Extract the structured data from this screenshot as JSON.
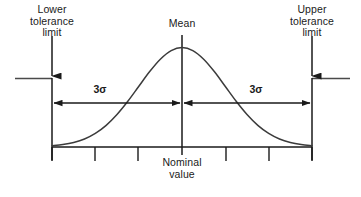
{
  "figure": {
    "labels": {
      "lower_tolerance": "Lower\ntolerance\nlimit",
      "upper_tolerance": "Upper\ntolerance\nlimit",
      "mean": "Mean",
      "nominal": "Nominal\nvalue",
      "sigma_left": "3σ",
      "sigma_right": "3σ"
    },
    "colors": {
      "line": "#1a1a1a",
      "curve": "#3b3b3b",
      "text": "#1a1a1a",
      "background": "#ffffff"
    }
  },
  "chart_data": {
    "type": "line",
    "xlabel": "Nominal value",
    "ylabel": "",
    "grid": false,
    "legend": null,
    "annotations": [
      {
        "name": "lower-tolerance-limit",
        "text": "Lower tolerance limit",
        "x": -3,
        "marker": "down-arrow"
      },
      {
        "name": "upper-tolerance-limit",
        "text": "Upper tolerance limit",
        "x": 3,
        "marker": "down-arrow"
      },
      {
        "name": "mean-line",
        "text": "Mean",
        "x": 0,
        "marker": "vertical-line"
      },
      {
        "name": "nominal-value",
        "text": "Nominal value",
        "x": 0,
        "marker": "axis-label"
      },
      {
        "name": "sigma-span-left",
        "text": "3σ",
        "from_x": -3,
        "to_x": 0,
        "marker": "double-arrow"
      },
      {
        "name": "sigma-span-right",
        "text": "3σ",
        "from_x": 0,
        "to_x": 3,
        "marker": "double-arrow"
      }
    ],
    "xlim": [
      -3,
      3
    ],
    "ylim": [
      0,
      1
    ],
    "xticks": [
      -3,
      -2,
      -1,
      0,
      1,
      2,
      3
    ],
    "xticklabels": [
      "",
      "",
      "",
      "",
      "",
      "",
      ""
    ],
    "series": [
      {
        "name": "normal-distribution",
        "mean": 0,
        "sigma": 1,
        "x": [
          -3.0,
          -2.75,
          -2.5,
          -2.25,
          -2.0,
          -1.75,
          -1.5,
          -1.25,
          -1.0,
          -0.75,
          -0.5,
          -0.25,
          0.0,
          0.25,
          0.5,
          0.75,
          1.0,
          1.25,
          1.5,
          1.75,
          2.0,
          2.25,
          2.5,
          2.75,
          3.0
        ],
        "values": [
          0.011,
          0.023,
          0.044,
          0.079,
          0.135,
          0.216,
          0.325,
          0.458,
          0.607,
          0.755,
          0.882,
          0.969,
          1.0,
          0.969,
          0.882,
          0.755,
          0.607,
          0.458,
          0.325,
          0.216,
          0.135,
          0.079,
          0.044,
          0.023,
          0.011
        ]
      }
    ]
  }
}
